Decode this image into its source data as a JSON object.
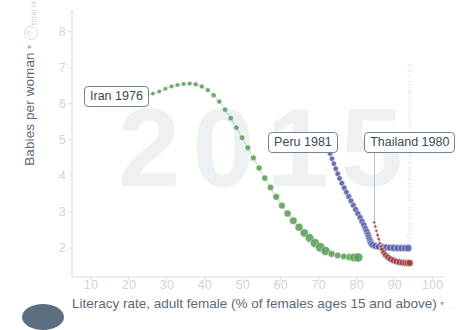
{
  "axes": {
    "y": {
      "title": "Babies per woman",
      "caret": "▾",
      "help_icon": "?",
      "sub_title": "total fertility",
      "ticks": [
        2,
        3,
        4,
        5,
        6,
        7,
        8
      ],
      "range": [
        1.2,
        8.6
      ]
    },
    "x": {
      "title": "Literacy rate, adult female (% of females ages 15 and above)",
      "caret": "▾",
      "trailing_dots": "...",
      "ticks": [
        10,
        20,
        30,
        40,
        50,
        60,
        70,
        80,
        90,
        100
      ],
      "range": [
        5,
        103
      ]
    }
  },
  "watermark": {
    "year": "2015"
  },
  "credit": {
    "text": "Size: Medical Doctors (per 1000 people)  Color: Main Religion"
  },
  "callouts": [
    {
      "id": "iran",
      "label": "Iran 1976"
    },
    {
      "id": "peru",
      "label": "Peru 1981"
    },
    {
      "id": "thailand",
      "label": "Thailand 1980"
    }
  ],
  "colors": {
    "iran_green": "#5a9e58",
    "peru_blue": "#5a5fa8",
    "thailand_red": "#9b3a3a",
    "axis": "#d8dfe4",
    "tick_text": "#ccd5dc",
    "title_text": "#5b6a78",
    "watermark": "#eef1f3",
    "callout_border": "#77838d"
  },
  "chart_data": {
    "type": "scatter",
    "title": "",
    "xlabel": "Literacy rate, adult female (% of females ages 15 and above)",
    "ylabel": "Babies per woman",
    "ylabel_sub": "total fertility",
    "xlim": [
      5,
      103
    ],
    "ylim": [
      1.2,
      8.6
    ],
    "xticks": [
      10,
      20,
      30,
      40,
      50,
      60,
      70,
      80,
      90,
      100
    ],
    "yticks": [
      2,
      3,
      4,
      5,
      6,
      7,
      8
    ],
    "grid": false,
    "legend": "none",
    "annotations": [
      {
        "text": "Iran 1976",
        "x": 24.5,
        "y": 6.25
      },
      {
        "text": "Peru 1981",
        "x": 73.0,
        "y": 4.7
      },
      {
        "text": "Thailand 1980",
        "x": 84.0,
        "y": 4.7
      }
    ],
    "series": [
      {
        "name": "Iran",
        "label": "Iran 1976",
        "color": "#5a9e58",
        "marker": "circle",
        "note": "trail from 1976 to 2015; bubble size grows with medical doctors per 1000",
        "points": [
          {
            "x": 24.5,
            "y": 6.22,
            "r": 2.1
          },
          {
            "x": 26.3,
            "y": 6.28,
            "r": 2.1
          },
          {
            "x": 28.0,
            "y": 6.34,
            "r": 2.2
          },
          {
            "x": 29.6,
            "y": 6.42,
            "r": 2.2
          },
          {
            "x": 31.2,
            "y": 6.48,
            "r": 2.2
          },
          {
            "x": 32.8,
            "y": 6.52,
            "r": 2.3
          },
          {
            "x": 34.4,
            "y": 6.55,
            "r": 2.3
          },
          {
            "x": 36.0,
            "y": 6.56,
            "r": 2.3
          },
          {
            "x": 37.6,
            "y": 6.54,
            "r": 2.4
          },
          {
            "x": 39.2,
            "y": 6.48,
            "r": 2.4
          },
          {
            "x": 40.8,
            "y": 6.38,
            "r": 2.4
          },
          {
            "x": 42.3,
            "y": 6.24,
            "r": 2.5
          },
          {
            "x": 43.8,
            "y": 6.06,
            "r": 2.5
          },
          {
            "x": 45.3,
            "y": 5.84,
            "r": 2.6
          },
          {
            "x": 46.8,
            "y": 5.6,
            "r": 2.6
          },
          {
            "x": 48.3,
            "y": 5.34,
            "r": 2.7
          },
          {
            "x": 49.8,
            "y": 5.06,
            "r": 2.7
          },
          {
            "x": 51.3,
            "y": 4.78,
            "r": 2.8
          },
          {
            "x": 52.8,
            "y": 4.5,
            "r": 2.9
          },
          {
            "x": 54.3,
            "y": 4.22,
            "r": 3.0
          },
          {
            "x": 55.8,
            "y": 3.94,
            "r": 3.1
          },
          {
            "x": 57.3,
            "y": 3.68,
            "r": 3.2
          },
          {
            "x": 58.8,
            "y": 3.42,
            "r": 3.3
          },
          {
            "x": 60.3,
            "y": 3.18,
            "r": 3.4
          },
          {
            "x": 61.8,
            "y": 2.96,
            "r": 3.6
          },
          {
            "x": 63.3,
            "y": 2.76,
            "r": 3.8
          },
          {
            "x": 64.8,
            "y": 2.58,
            "r": 4.0
          },
          {
            "x": 66.2,
            "y": 2.42,
            "r": 4.2
          },
          {
            "x": 67.6,
            "y": 2.28,
            "r": 4.4
          },
          {
            "x": 69.0,
            "y": 2.14,
            "r": 4.6
          },
          {
            "x": 70.4,
            "y": 2.02,
            "r": 4.7
          },
          {
            "x": 71.8,
            "y": 1.92,
            "r": 4.5
          },
          {
            "x": 73.4,
            "y": 1.84,
            "r": 3.4
          },
          {
            "x": 75.0,
            "y": 1.8,
            "r": 3.2
          },
          {
            "x": 76.6,
            "y": 1.77,
            "r": 3.2
          },
          {
            "x": 78.1,
            "y": 1.75,
            "r": 3.6
          },
          {
            "x": 79.3,
            "y": 1.74,
            "r": 4.3
          },
          {
            "x": 80.4,
            "y": 1.74,
            "r": 4.6
          }
        ]
      },
      {
        "name": "Peru",
        "label": "Peru 1981",
        "color": "#5a5fa8",
        "marker": "circle",
        "note": "steep fertility decline then flat at high literacy",
        "points": [
          {
            "x": 73.0,
            "y": 4.62,
            "r": 2.6
          },
          {
            "x": 73.5,
            "y": 4.48,
            "r": 2.6
          },
          {
            "x": 74.0,
            "y": 4.34,
            "r": 2.6
          },
          {
            "x": 74.5,
            "y": 4.2,
            "r": 2.7
          },
          {
            "x": 75.0,
            "y": 4.06,
            "r": 2.7
          },
          {
            "x": 75.5,
            "y": 3.93,
            "r": 2.7
          },
          {
            "x": 76.1,
            "y": 3.8,
            "r": 2.8
          },
          {
            "x": 76.7,
            "y": 3.67,
            "r": 2.8
          },
          {
            "x": 77.3,
            "y": 3.55,
            "r": 2.8
          },
          {
            "x": 77.9,
            "y": 3.43,
            "r": 2.9
          },
          {
            "x": 78.5,
            "y": 3.31,
            "r": 2.9
          },
          {
            "x": 79.1,
            "y": 3.19,
            "r": 2.9
          },
          {
            "x": 79.7,
            "y": 3.07,
            "r": 3.0
          },
          {
            "x": 80.3,
            "y": 2.96,
            "r": 3.0
          },
          {
            "x": 80.9,
            "y": 2.85,
            "r": 3.0
          },
          {
            "x": 81.4,
            "y": 2.74,
            "r": 3.1
          },
          {
            "x": 81.9,
            "y": 2.64,
            "r": 3.1
          },
          {
            "x": 82.3,
            "y": 2.54,
            "r": 3.1
          },
          {
            "x": 82.7,
            "y": 2.45,
            "r": 3.2
          },
          {
            "x": 83.0,
            "y": 2.37,
            "r": 3.2
          },
          {
            "x": 83.2,
            "y": 2.3,
            "r": 3.2
          },
          {
            "x": 83.4,
            "y": 2.24,
            "r": 3.3
          },
          {
            "x": 83.6,
            "y": 2.18,
            "r": 3.3
          },
          {
            "x": 83.8,
            "y": 2.13,
            "r": 3.3
          },
          {
            "x": 84.2,
            "y": 2.09,
            "r": 3.4
          },
          {
            "x": 84.9,
            "y": 2.06,
            "r": 3.4
          },
          {
            "x": 85.8,
            "y": 2.04,
            "r": 3.4
          },
          {
            "x": 86.8,
            "y": 2.03,
            "r": 3.5
          },
          {
            "x": 87.8,
            "y": 2.02,
            "r": 3.5
          },
          {
            "x": 88.8,
            "y": 2.01,
            "r": 3.5
          },
          {
            "x": 89.8,
            "y": 2.01,
            "r": 3.6
          },
          {
            "x": 90.8,
            "y": 2.0,
            "r": 3.6
          },
          {
            "x": 91.8,
            "y": 2.0,
            "r": 3.7
          },
          {
            "x": 92.8,
            "y": 2.0,
            "r": 3.7
          },
          {
            "x": 93.6,
            "y": 2.0,
            "r": 3.7
          }
        ]
      },
      {
        "name": "Thailand",
        "label": "Thailand 1980",
        "color": "#9b3a3a",
        "marker": "circle",
        "note": "small dotted segment then solid curve down to lowest fertility",
        "points": [
          {
            "x": 84.6,
            "y": 2.72,
            "r": 1.5
          },
          {
            "x": 84.9,
            "y": 2.6,
            "r": 1.5
          },
          {
            "x": 85.2,
            "y": 2.48,
            "r": 1.5
          },
          {
            "x": 85.5,
            "y": 2.36,
            "r": 1.6
          },
          {
            "x": 85.8,
            "y": 2.25,
            "r": 1.6
          },
          {
            "x": 86.1,
            "y": 2.14,
            "r": 1.6
          },
          {
            "x": 86.4,
            "y": 2.04,
            "r": 1.7
          },
          {
            "x": 86.7,
            "y": 1.96,
            "r": 2.4
          },
          {
            "x": 87.1,
            "y": 1.88,
            "r": 2.8
          },
          {
            "x": 87.6,
            "y": 1.81,
            "r": 3.0
          },
          {
            "x": 88.2,
            "y": 1.75,
            "r": 3.1
          },
          {
            "x": 88.9,
            "y": 1.7,
            "r": 3.2
          },
          {
            "x": 89.7,
            "y": 1.66,
            "r": 3.3
          },
          {
            "x": 90.5,
            "y": 1.63,
            "r": 3.3
          },
          {
            "x": 91.3,
            "y": 1.61,
            "r": 3.4
          },
          {
            "x": 92.1,
            "y": 1.6,
            "r": 3.4
          },
          {
            "x": 92.8,
            "y": 1.59,
            "r": 3.4
          },
          {
            "x": 93.4,
            "y": 1.59,
            "r": 3.5
          },
          {
            "x": 94.0,
            "y": 1.59,
            "r": 3.5
          }
        ]
      }
    ]
  }
}
